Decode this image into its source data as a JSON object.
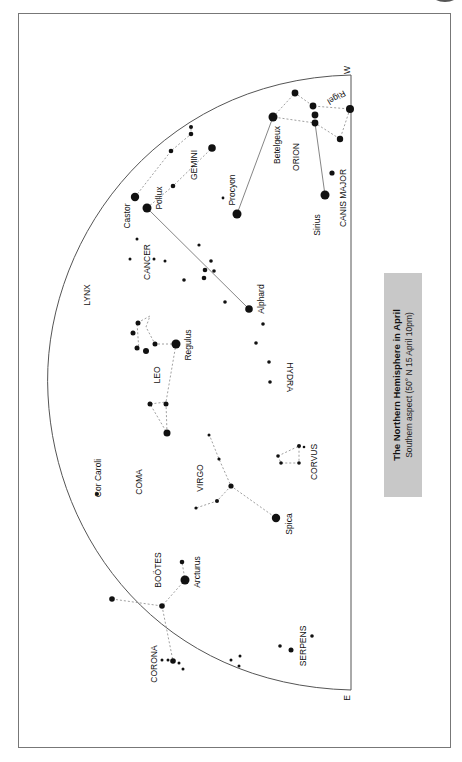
{
  "title_box": {
    "title": "The Northern Hemisphere in April",
    "subtitle": "Southern aspect (50° N 15 April 10pm)"
  },
  "directions": {
    "west": "W",
    "east": "E"
  },
  "constellations": {
    "lynx": "LYNX",
    "gemini": "GEMINI",
    "cancer": "CANCER",
    "orion": "ORION",
    "canis_major": "CANIS MAJOR",
    "leo": "LEO",
    "hydra": "HYDRA",
    "coma": "COMA",
    "virgo": "VIRGO",
    "corvus": "CORVUS",
    "bootes": "BOÖTES",
    "corona": "CORONA",
    "serpens": "SERPENS"
  },
  "stars": {
    "castor": "Castor",
    "pollux": "Pollux",
    "procyon": "Procyon",
    "betelgeux": "Betelgeux",
    "rigel": "Rigel",
    "sirius": "Sirius",
    "alphard": "Alphard",
    "regulus": "Regulus",
    "cor_caroli": "Cor Caroli",
    "spica": "Spica",
    "arcturus": "Arcturus"
  },
  "colors": {
    "title_box_bg": "#c8c8c8",
    "ink": "#111111",
    "frame": "#777777"
  }
}
